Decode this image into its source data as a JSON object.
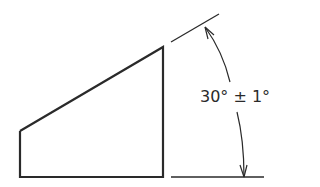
{
  "diagram": {
    "type": "angular-dimension-drawing",
    "dimension_label": "30° ± 1°",
    "nominal_angle_deg": 30,
    "tolerance_deg": 1,
    "stroke_color": "#2a2a2a",
    "background": "#ffffff"
  }
}
